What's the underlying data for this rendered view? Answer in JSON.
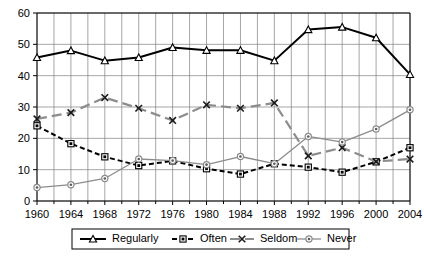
{
  "chart_data": {
    "type": "line",
    "title": "",
    "subtitle": "",
    "xlabel": "",
    "ylabel": "",
    "x": [
      1960,
      1964,
      1968,
      1972,
      1976,
      1980,
      1984,
      1988,
      1992,
      1996,
      2000,
      2004
    ],
    "categories": [
      "1960",
      "1964",
      "1968",
      "1972",
      "1976",
      "1980",
      "1984",
      "1988",
      "1992",
      "1996",
      "2000",
      "2004"
    ],
    "xticklabels": [
      "1960",
      "1964",
      "1968",
      "1972",
      "1976",
      "1980",
      "1984",
      "1988",
      "1992",
      "1996",
      "2000",
      "2004"
    ],
    "yticklabels": [
      "0",
      "10",
      "20",
      "30",
      "40",
      "50",
      "60"
    ],
    "yticks": [
      0,
      10,
      20,
      30,
      40,
      50,
      60
    ],
    "xlim": [
      1960,
      2004
    ],
    "ylim": [
      0,
      60
    ],
    "grid": true,
    "minor_x_ticks_interval": 2,
    "legend_position": "bottom",
    "series": [
      {
        "name": "Regularly",
        "color": "#000000",
        "marker": "triangle",
        "linestyle": "solid",
        "values": [
          45.8,
          48.0,
          44.8,
          45.8,
          49.0,
          48.1,
          48.1,
          44.8,
          54.7,
          55.5,
          52.1,
          40.4
        ]
      },
      {
        "name": "Often",
        "color": "#000000",
        "marker": "square",
        "linestyle": "dashed",
        "values": [
          24.0,
          18.3,
          14.1,
          11.3,
          12.8,
          10.3,
          8.6,
          11.9,
          10.8,
          9.2,
          12.5,
          17.0
        ]
      },
      {
        "name": "Seldom",
        "color": "#8c8c8c",
        "marker": "x",
        "linestyle": "dashdot",
        "values": [
          26.2,
          28.2,
          33.0,
          29.6,
          25.7,
          30.7,
          29.6,
          31.3,
          14.4,
          17.0,
          12.6,
          13.4
        ]
      },
      {
        "name": "Never",
        "color": "#8c8c8c",
        "marker": "circle",
        "linestyle": "solid",
        "values": [
          4.3,
          5.2,
          7.2,
          13.4,
          12.9,
          11.6,
          14.2,
          11.9,
          20.6,
          18.8,
          23.0,
          29.1
        ]
      }
    ]
  },
  "legend": {
    "items": [
      {
        "label": "Regularly"
      },
      {
        "label": "Often"
      },
      {
        "label": "Seldom"
      },
      {
        "label": "Never"
      }
    ]
  }
}
